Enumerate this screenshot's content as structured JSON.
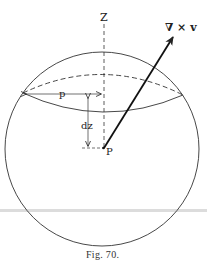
{
  "figure": {
    "caption": "Fig. 70.",
    "labels": {
      "axis": "Z",
      "vector": "∇ × v",
      "radius": "p",
      "height": "dz",
      "point": "P"
    },
    "colors": {
      "ink": "#222222",
      "scan_line": "#d9d9d9",
      "background": "#ffffff"
    }
  }
}
